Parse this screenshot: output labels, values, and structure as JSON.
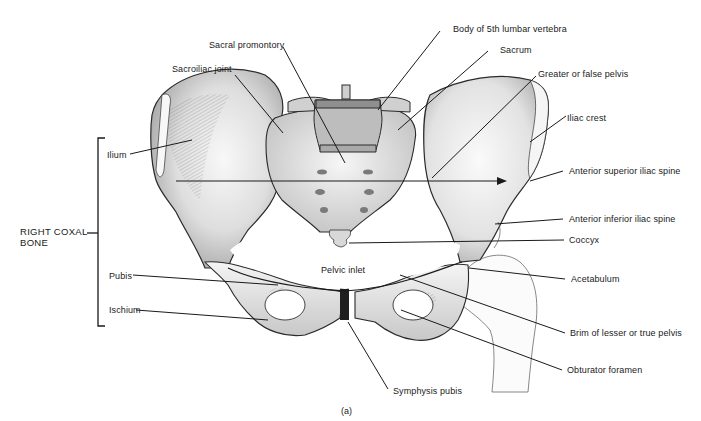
{
  "figure": {
    "caption": "(a)",
    "group_label": {
      "line1": "RIGHT COXAL",
      "line2": "BONE"
    },
    "left_labels": [
      {
        "id": "ilium",
        "text": "Ilium"
      },
      {
        "id": "pubis",
        "text": "Pubis"
      },
      {
        "id": "ischium",
        "text": "Ischium"
      }
    ],
    "top_labels": [
      {
        "id": "sacroiliac-joint",
        "text": "Sacroiliac joint"
      },
      {
        "id": "sacral-promontory",
        "text": "Sacral promontory"
      }
    ],
    "right_labels": [
      {
        "id": "body-5th-lumbar",
        "text": "Body of 5th lumbar vertebra"
      },
      {
        "id": "sacrum",
        "text": "Sacrum"
      },
      {
        "id": "greater-pelvis",
        "text": "Greater or false pelvis"
      },
      {
        "id": "iliac-crest",
        "text": "Iliac crest"
      },
      {
        "id": "asis",
        "text": "Anterior superior iliac spine"
      },
      {
        "id": "aiis",
        "text": "Anterior inferior iliac spine"
      },
      {
        "id": "coccyx",
        "text": "Coccyx"
      },
      {
        "id": "acetabulum",
        "text": "Acetabulum"
      },
      {
        "id": "brim-lesser-pelvis",
        "text": "Brim of lesser or true pelvis"
      },
      {
        "id": "obturator-foramen",
        "text": "Obturator foramen"
      }
    ],
    "center_labels": [
      {
        "id": "pelvic-inlet",
        "text": "Pelvic inlet"
      },
      {
        "id": "symphysis-pubis",
        "text": "Symphysis pubis"
      }
    ],
    "colors": {
      "ink": "#1a1a1a",
      "bone_light": "#f1f1f1",
      "bone_mid": "#d6d6d6",
      "bone_dark": "#9a9a9a",
      "background": "#ffffff"
    }
  }
}
